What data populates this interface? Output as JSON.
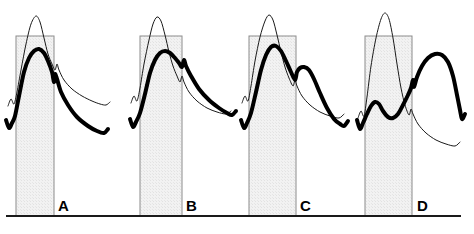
{
  "figure": {
    "title": "",
    "background_color": "#ffffff",
    "width": 474,
    "height": 234,
    "baseline": {
      "label": "baseline-axis",
      "y": 216,
      "x_start": 6,
      "x_end": 461,
      "color": "#1a1a1a",
      "thickness": 2
    },
    "style": {
      "thin_curve_color": "#1a1a1a",
      "thin_curve_width": 1,
      "thick_curve_color": "#000000",
      "thick_curve_width": 4,
      "band_fill": "#f0f0f0",
      "band_stroke": "#8c8c8c",
      "band_stroke_width": 1
    }
  },
  "chart_data": {
    "type": "line",
    "title": "",
    "xlabel": "",
    "ylabel": "",
    "grid": false,
    "legend_position": "none",
    "panel_count": 4,
    "series_names": [
      "reference-thin-curve",
      "experimental-thick-curve"
    ],
    "annotation": "Each panel overlays a thin reference waveform and a thick experimental waveform against a shaded interval band; the thick curve peak shifts progressively later relative to the band from A to D.",
    "panels": [
      {
        "label": "A",
        "label_x": 58,
        "label_y": 211,
        "band": {
          "x_start": 16,
          "x_end": 54,
          "y_top": 36,
          "y_bottom": 216
        },
        "thin_curve": {
          "name": "reference-thin-curve",
          "points": [
            [
              8,
              106
            ],
            [
              11,
              99
            ],
            [
              14,
              104
            ],
            [
              17,
              92
            ],
            [
              21,
              70
            ],
            [
              26,
              44
            ],
            [
              31,
              24
            ],
            [
              36,
              16
            ],
            [
              40,
              22
            ],
            [
              44,
              38
            ],
            [
              48,
              54
            ],
            [
              52,
              64
            ],
            [
              55,
              70
            ],
            [
              57,
              64
            ],
            [
              59,
              70
            ],
            [
              64,
              80
            ],
            [
              72,
              89
            ],
            [
              82,
              96
            ],
            [
              92,
              101
            ],
            [
              100,
              104
            ],
            [
              106,
              105
            ],
            [
              110,
              102
            ]
          ]
        },
        "thick_curve": {
          "name": "experimental-thick-curve",
          "points": [
            [
              6,
              120
            ],
            [
              9,
              128
            ],
            [
              12,
              123
            ],
            [
              15,
              116
            ],
            [
              19,
              96
            ],
            [
              24,
              72
            ],
            [
              29,
              58
            ],
            [
              34,
              51
            ],
            [
              39,
              49
            ],
            [
              44,
              53
            ],
            [
              48,
              61
            ],
            [
              52,
              72
            ],
            [
              54,
              82
            ],
            [
              55,
              74
            ],
            [
              57,
              79
            ],
            [
              61,
              92
            ],
            [
              68,
              105
            ],
            [
              77,
              117
            ],
            [
              88,
              126
            ],
            [
              97,
              131
            ],
            [
              104,
              133
            ],
            [
              108,
              129
            ]
          ]
        }
      },
      {
        "label": "B",
        "label_x": 186,
        "label_y": 211,
        "band": {
          "x_start": 140,
          "x_end": 182,
          "y_top": 36,
          "y_bottom": 216
        },
        "thin_curve": {
          "name": "reference-thin-curve",
          "points": [
            [
              131,
              103
            ],
            [
              134,
              96
            ],
            [
              137,
              101
            ],
            [
              140,
              88
            ],
            [
              144,
              64
            ],
            [
              149,
              40
            ],
            [
              153,
              24
            ],
            [
              157,
              17
            ],
            [
              161,
              21
            ],
            [
              165,
              35
            ],
            [
              169,
              52
            ],
            [
              173,
              66
            ],
            [
              177,
              76
            ],
            [
              180,
              82
            ],
            [
              182,
              76
            ],
            [
              184,
              82
            ],
            [
              189,
              92
            ],
            [
              197,
              101
            ],
            [
              207,
              108
            ],
            [
              217,
              112
            ],
            [
              226,
              114
            ],
            [
              231,
              111
            ]
          ]
        },
        "thick_curve": {
          "name": "experimental-thick-curve",
          "points": [
            [
              130,
              119
            ],
            [
              133,
              127
            ],
            [
              136,
              122
            ],
            [
              140,
              113
            ],
            [
              145,
              94
            ],
            [
              150,
              73
            ],
            [
              155,
              60
            ],
            [
              160,
              53
            ],
            [
              165,
              51
            ],
            [
              170,
              53
            ],
            [
              175,
              58
            ],
            [
              179,
              63
            ],
            [
              182,
              67
            ],
            [
              184,
              60
            ],
            [
              186,
              66
            ],
            [
              191,
              76
            ],
            [
              199,
              89
            ],
            [
              209,
              100
            ],
            [
              219,
              108
            ],
            [
              227,
              113
            ],
            [
              232,
              115
            ],
            [
              236,
              111
            ]
          ]
        }
      },
      {
        "label": "C",
        "label_x": 300,
        "label_y": 211,
        "band": {
          "x_start": 249,
          "x_end": 296,
          "y_top": 36,
          "y_bottom": 216
        },
        "thin_curve": {
          "name": "reference-thin-curve",
          "points": [
            [
              242,
              103
            ],
            [
              245,
              96
            ],
            [
              248,
              101
            ],
            [
              251,
              86
            ],
            [
              255,
              61
            ],
            [
              260,
              37
            ],
            [
              265,
              21
            ],
            [
              269,
              15
            ],
            [
              273,
              20
            ],
            [
              277,
              35
            ],
            [
              281,
              52
            ],
            [
              285,
              67
            ],
            [
              289,
              78
            ],
            [
              293,
              86
            ],
            [
              295,
              80
            ],
            [
              297,
              86
            ],
            [
              302,
              96
            ],
            [
              310,
              105
            ],
            [
              320,
              112
            ],
            [
              330,
              116
            ],
            [
              339,
              118
            ],
            [
              344,
              114
            ]
          ]
        },
        "thick_curve": {
          "name": "experimental-thick-curve",
          "points": [
            [
              241,
              120
            ],
            [
              244,
              128
            ],
            [
              247,
              123
            ],
            [
              251,
              113
            ],
            [
              256,
              92
            ],
            [
              261,
              70
            ],
            [
              266,
              55
            ],
            [
              271,
              47
            ],
            [
              276,
              46
            ],
            [
              281,
              51
            ],
            [
              286,
              61
            ],
            [
              291,
              72
            ],
            [
              295,
              80
            ],
            [
              297,
              72
            ],
            [
              300,
              68
            ],
            [
              304,
              67
            ],
            [
              309,
              70
            ],
            [
              314,
              79
            ],
            [
              320,
              93
            ],
            [
              327,
              108
            ],
            [
              334,
              119
            ],
            [
              340,
              124
            ],
            [
              344,
              126
            ],
            [
              348,
              121
            ]
          ]
        }
      },
      {
        "label": "D",
        "label_x": 417,
        "label_y": 211,
        "band": {
          "x_start": 365,
          "x_end": 412,
          "y_top": 36,
          "y_bottom": 216
        },
        "thin_curve": {
          "name": "reference-thin-curve",
          "points": [
            [
              358,
              118
            ],
            [
              361,
              111
            ],
            [
              364,
              116
            ],
            [
              367,
              97
            ],
            [
              371,
              66
            ],
            [
              376,
              38
            ],
            [
              381,
              19
            ],
            [
              385,
              13
            ],
            [
              389,
              19
            ],
            [
              393,
              38
            ],
            [
              397,
              64
            ],
            [
              401,
              88
            ],
            [
              405,
              105
            ],
            [
              409,
              115
            ],
            [
              411,
              109
            ],
            [
              413,
              114
            ],
            [
              418,
              124
            ],
            [
              426,
              133
            ],
            [
              436,
              140
            ],
            [
              446,
              144
            ],
            [
              455,
              146
            ],
            [
              460,
              142
            ]
          ]
        },
        "thick_curve": {
          "name": "experimental-thick-curve",
          "points": [
            [
              357,
              120
            ],
            [
              360,
              129
            ],
            [
              363,
              123
            ],
            [
              367,
              114
            ],
            [
              371,
              106
            ],
            [
              375,
              102
            ],
            [
              379,
              104
            ],
            [
              383,
              111
            ],
            [
              388,
              117
            ],
            [
              393,
              118
            ],
            [
              398,
              114
            ],
            [
              403,
              105
            ],
            [
              408,
              95
            ],
            [
              411,
              88
            ],
            [
              413,
              80
            ],
            [
              414,
              87
            ],
            [
              417,
              77
            ],
            [
              422,
              66
            ],
            [
              428,
              58
            ],
            [
              435,
              54
            ],
            [
              442,
              55
            ],
            [
              448,
              62
            ],
            [
              453,
              76
            ],
            [
              457,
              95
            ],
            [
              460,
              110
            ],
            [
              462,
              119
            ],
            [
              465,
              114
            ]
          ]
        }
      }
    ]
  }
}
